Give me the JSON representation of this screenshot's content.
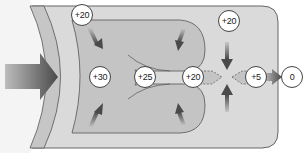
{
  "diagram": {
    "colors": {
      "outer_fill": "#d8d8d8",
      "inner_fill": "#c2c2c2",
      "band_fill": "#c8c8c8",
      "arrow": "#555555",
      "outline": "#555555",
      "circle_fill": "#ffffff"
    },
    "nodes": [
      {
        "id": "top-left",
        "label": "+20"
      },
      {
        "id": "left-center",
        "label": "+30"
      },
      {
        "id": "center",
        "label": "+25"
      },
      {
        "id": "channel-entry",
        "label": "+20"
      },
      {
        "id": "top-right",
        "label": "+20"
      },
      {
        "id": "outlet",
        "label": "+5"
      },
      {
        "id": "outside",
        "label": "0"
      }
    ]
  }
}
